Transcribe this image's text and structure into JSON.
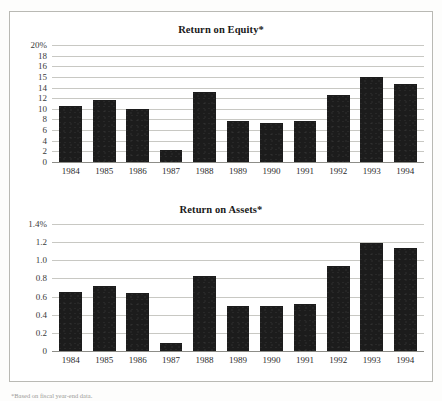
{
  "figure": {
    "footnote": "*Based on fiscal year-end data."
  },
  "chart_data": [
    {
      "type": "bar",
      "title": "Return on Equity*",
      "xlabel": "",
      "ylabel": "",
      "categories": [
        "1984",
        "1985",
        "1986",
        "1987",
        "1988",
        "1989",
        "1990",
        "1991",
        "1992",
        "1993",
        "1994"
      ],
      "values": [
        10.5,
        11.6,
        10.0,
        2.2,
        13.2,
        7.7,
        7.4,
        7.7,
        12.6,
        15.0,
        14.3
      ],
      "ylim": [
        0,
        20
      ],
      "yticks": [
        20,
        18,
        16,
        15,
        14,
        12,
        10,
        8,
        6,
        4,
        2,
        0
      ],
      "ytick_labels": [
        "20%",
        "18",
        "16",
        "15",
        "14",
        "12",
        "10",
        "8",
        "6",
        "4",
        "2",
        "0"
      ],
      "grid": true,
      "legend": false,
      "bar_color": "#1c1c1c"
    },
    {
      "type": "bar",
      "title": "Return on Assets*",
      "xlabel": "",
      "ylabel": "",
      "categories": [
        "1984",
        "1985",
        "1986",
        "1987",
        "1988",
        "1989",
        "1990",
        "1991",
        "1992",
        "1993",
        "1994"
      ],
      "values": [
        0.65,
        0.72,
        0.64,
        0.09,
        0.83,
        0.5,
        0.5,
        0.52,
        0.94,
        1.19,
        1.14
      ],
      "ylim": [
        0,
        1.4
      ],
      "yticks": [
        1.4,
        1.2,
        1.0,
        0.8,
        0.6,
        0.4,
        0.2,
        0
      ],
      "ytick_labels": [
        "1.4%",
        "1.2",
        "1.0",
        "0.8",
        "0.6",
        "0.4",
        "0.2",
        "0"
      ],
      "grid": true,
      "legend": false,
      "bar_color": "#1c1c1c"
    }
  ]
}
